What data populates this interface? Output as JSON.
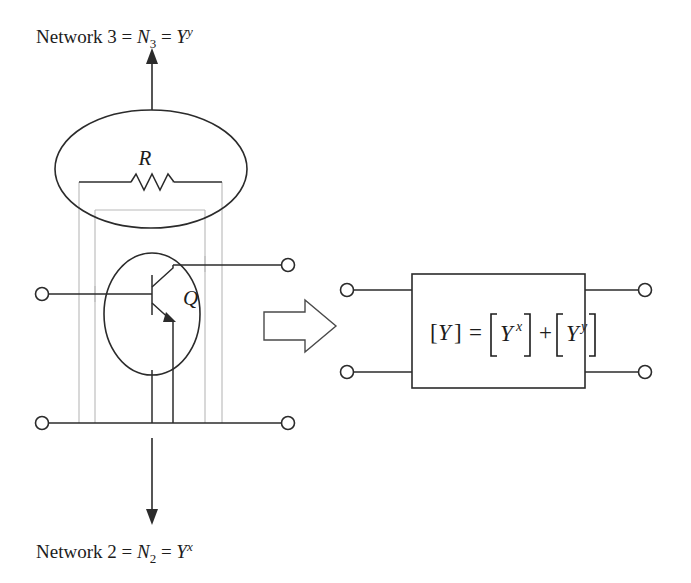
{
  "figure": {
    "top_label": {
      "prefix": "Network 3 = ",
      "n_symbol": "N",
      "n_subscript": "3",
      "equals": " = ",
      "y_symbol": "Y",
      "y_superscript": "y"
    },
    "bottom_label": {
      "prefix": "Network 2 = ",
      "n_symbol": "N",
      "n_subscript": "2",
      "equals": " = ",
      "y_symbol": "Y",
      "y_superscript": "x"
    },
    "components": {
      "resistor_label": "R",
      "transistor_label": "Q"
    },
    "equation": {
      "lhs_open": "[",
      "lhs_symbol": "Y",
      "lhs_close": "]",
      "equals": "=",
      "term1_open": "[",
      "term1_symbol": "Y",
      "term1_superscript": "x",
      "term1_close": "]",
      "plus": "+",
      "term2_open": "[",
      "term2_symbol": "Y",
      "term2_superscript": "y",
      "term2_close": "]"
    },
    "colors": {
      "ink": "#2b2b2b",
      "faint": "#b9b9b9",
      "background": "#ffffff"
    }
  }
}
